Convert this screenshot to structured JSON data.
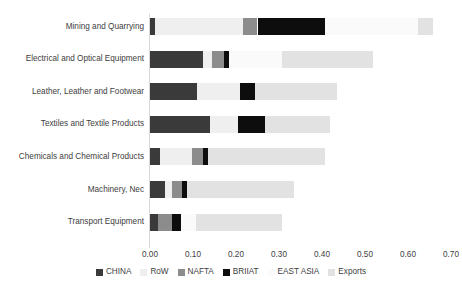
{
  "chart_data": {
    "type": "bar",
    "orientation": "horizontal",
    "stacked": true,
    "title": "",
    "xlabel": "",
    "ylabel": "",
    "xlim": [
      0.0,
      0.7
    ],
    "xticks": [
      "0.00",
      "0.10",
      "0.20",
      "0.30",
      "0.40",
      "0.50",
      "0.60",
      "0.70"
    ],
    "xtick_values": [
      0.0,
      0.1,
      0.2,
      0.3,
      0.4,
      0.5,
      0.6,
      0.7
    ],
    "grid": false,
    "legend_position": "bottom",
    "categories": [
      "Mining and Quarrying",
      "Electrical and Optical Equipment",
      "Leather, Leather and Footwear",
      "Textiles and Textile Products",
      "Chemicals and Chemical Products",
      "Machinery, Nec",
      "Transport Equipment"
    ],
    "series": [
      {
        "name": "CHINA",
        "color": "#3a3a3a",
        "values": [
          0.012,
          0.123,
          0.11,
          0.14,
          0.023,
          0.035,
          0.019
        ]
      },
      {
        "name": "RoW",
        "color": "#efefef",
        "values": [
          0.205,
          0.022,
          0.1,
          0.065,
          0.075,
          0.016,
          0.0
        ]
      },
      {
        "name": "NAFTA",
        "color": "#8c8c8c",
        "values": [
          0.033,
          0.026,
          0.0,
          0.0,
          0.026,
          0.023,
          0.033
        ]
      },
      {
        "name": "BRIIAT",
        "color": "#0d0d0d",
        "values": [
          0.158,
          0.012,
          0.035,
          0.063,
          0.012,
          0.012,
          0.019
        ]
      },
      {
        "name": "EAST ASIA",
        "color": "#fafafa",
        "values": [
          0.215,
          0.125,
          0.0,
          0.0,
          0.0,
          0.0,
          0.035
        ]
      },
      {
        "name": "Exports",
        "color": "#e2e2e2",
        "values": [
          0.035,
          0.21,
          0.19,
          0.15,
          0.27,
          0.25,
          0.2
        ]
      }
    ]
  },
  "legend": {
    "items": [
      {
        "label": "CHINA"
      },
      {
        "label": "RoW"
      },
      {
        "label": "NAFTA"
      },
      {
        "label": "BRIIAT"
      },
      {
        "label": "EAST ASIA"
      },
      {
        "label": "Exports"
      }
    ]
  },
  "axis": {
    "x_tick_labels": [
      "0.00",
      "0.10",
      "0.20",
      "0.30",
      "0.40",
      "0.50",
      "0.60",
      "0.70"
    ]
  }
}
